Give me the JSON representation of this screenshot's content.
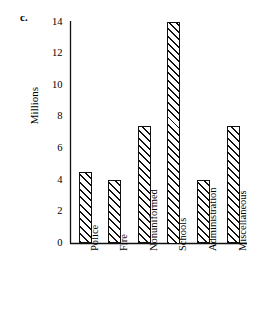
{
  "panel": {
    "label": "c."
  },
  "chart_data": {
    "type": "bar",
    "title": "",
    "xlabel": "",
    "ylabel": "Millions",
    "categories": [
      "Police",
      "Fire",
      "Nonuniformed",
      "Schools",
      "Administration",
      "Miscellaneous"
    ],
    "values": [
      4.5,
      4.0,
      7.4,
      14.0,
      4.0,
      7.4
    ],
    "ylim": [
      0,
      14
    ],
    "ytick_labels": [
      "0",
      "2",
      "4",
      "6",
      "8",
      "10",
      "12",
      "14"
    ],
    "ytick_values": [
      0,
      2,
      4,
      6,
      8,
      10,
      12,
      14
    ],
    "grid": false,
    "legend": false,
    "bar_fill": "hatched-diagonal",
    "bar_outline_color": "#111111",
    "background_color": "#ffffff",
    "x_label_rotation": -90
  }
}
